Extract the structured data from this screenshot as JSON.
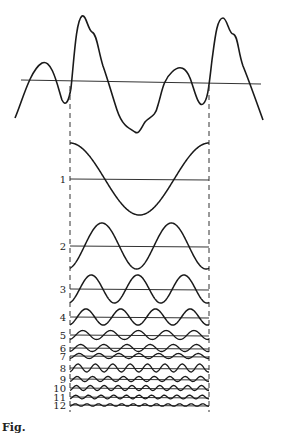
{
  "figure": {
    "type": "fourier-decomposition-diagram",
    "composite_wave": {
      "label": ""
    },
    "period_markers": {
      "style": "dashed",
      "count": 2
    },
    "harmonics": [
      {
        "label": "1",
        "cycles": 1,
        "amplitude": 36,
        "phase": 0
      },
      {
        "label": "2",
        "cycles": 2,
        "amplitude": 23,
        "phase": 3.4
      },
      {
        "label": "3",
        "cycles": 3,
        "amplitude": 14,
        "phase": 3.4
      },
      {
        "label": "4",
        "cycles": 4,
        "amplitude": 8,
        "phase": 3.4
      },
      {
        "label": "5",
        "cycles": 5,
        "amplitude": 4.5,
        "phase": 3.4
      },
      {
        "label": "6",
        "cycles": 6,
        "amplitude": 3.5,
        "phase": 3.4
      },
      {
        "label": "7",
        "cycles": 7,
        "amplitude": 2.5,
        "phase": 3.4
      },
      {
        "label": "8",
        "cycles": 8,
        "amplitude": 4,
        "phase": 3.4
      },
      {
        "label": "9",
        "cycles": 9,
        "amplitude": 2.5,
        "phase": 3.4
      },
      {
        "label": "10",
        "cycles": 10,
        "amplitude": 2.5,
        "phase": 3.4
      },
      {
        "label": "11",
        "cycles": 11,
        "amplitude": 1.8,
        "phase": 3.4
      },
      {
        "label": "12",
        "cycles": 12,
        "amplitude": 1.2,
        "phase": 3.4
      }
    ],
    "caption": "Fig."
  },
  "colors": {
    "ink": "#1a1a1a",
    "background": "#ffffff"
  }
}
